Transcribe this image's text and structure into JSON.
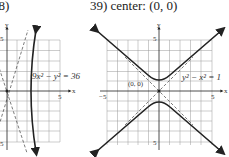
{
  "problems": [
    {
      "label": "38)",
      "equation": "9x² − y² = 36",
      "tick_x": "5",
      "tick_y_top": "5",
      "tick_y_bottom": "5",
      "axis_x": "x",
      "axis_y": "y"
    },
    {
      "label": "39) center: (0, 0)",
      "equation": "y² − x² = 1",
      "center_label": "(0, 0)",
      "tick_x_left": "−5",
      "tick_x_right": "5",
      "tick_y_top": "5",
      "tick_y_bottom": "5",
      "axis_x": "x",
      "axis_y": "y"
    }
  ]
}
